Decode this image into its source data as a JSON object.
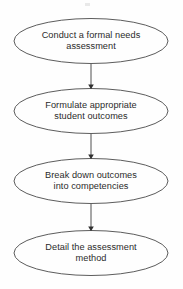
{
  "diagram": {
    "type": "flowchart",
    "orientation": "vertical",
    "node_shape": "ellipse",
    "colors": {
      "background": "#fefefe",
      "node_stroke": "#4a4a4a",
      "node_fill": "none",
      "text": "#2b2b2b",
      "connector": "#3d3d3d"
    },
    "nodes": [
      {
        "id": "node-1",
        "name": "conduct-needs-assessment",
        "lines": [
          "Conduct a formal needs",
          "assessment"
        ],
        "text": "Conduct a formal needs assessment",
        "cx": 91,
        "cy": 41,
        "rx": 77,
        "ry": 22.5
      },
      {
        "id": "node-2",
        "name": "formulate-student-outcomes",
        "lines": [
          "Formulate appropriate",
          "student outcomes"
        ],
        "text": "Formulate appropriate student outcomes",
        "cx": 91,
        "cy": 111,
        "rx": 77,
        "ry": 22.5
      },
      {
        "id": "node-3",
        "name": "break-down-competencies",
        "lines": [
          "Break down outcomes",
          "into competencies"
        ],
        "text": "Break down outcomes into competencies",
        "cx": 91,
        "cy": 181,
        "rx": 77,
        "ry": 22.5
      },
      {
        "id": "node-4",
        "name": "detail-assessment-method",
        "lines": [
          "Detail the assessment",
          "method"
        ],
        "text": "Detail the assessment method",
        "cx": 91,
        "cy": 253,
        "rx": 77,
        "ry": 22.5
      }
    ],
    "connectors": [
      {
        "id": "arrow-1",
        "name": "arrow-node1-to-node2",
        "from": "node-1",
        "to": "node-2",
        "x": 91,
        "y1": 64,
        "y2": 88
      },
      {
        "id": "arrow-2",
        "name": "arrow-node2-to-node3",
        "from": "node-2",
        "to": "node-3",
        "x": 91,
        "y1": 134,
        "y2": 158
      },
      {
        "id": "arrow-3",
        "name": "arrow-node3-to-node4",
        "from": "node-3",
        "to": "node-4",
        "x": 91,
        "y1": 204,
        "y2": 230
      }
    ]
  }
}
